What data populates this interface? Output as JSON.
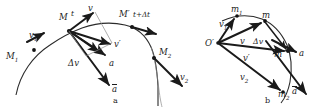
{
  "figure": {
    "background_color": "#ffffff",
    "ink_color": "#1c1c1c",
    "width": 318,
    "height": 108
  },
  "panel_a": {
    "caption": "a",
    "labels": {
      "point_M1": "M",
      "point_M1_sub": "1",
      "point_M": "M",
      "time_t": "t",
      "point_Mprime": "M′",
      "time_t_plus_dt": "t+Δt",
      "point_M2": "M",
      "point_M2_sub": "2",
      "vel_v1": "v",
      "vel_v1_sub": "1",
      "vel_v": "v",
      "vel_vprime": "v′",
      "vel_v2": "v",
      "vel_v2_sub": "2",
      "delta_v": "Δv",
      "accel_a": "a",
      "accel_a_bar": "a"
    }
  },
  "panel_b": {
    "caption": "b",
    "labels": {
      "origin": "O′",
      "point_m1": "m",
      "point_m1_sub": "1",
      "point_m": "m",
      "point_mprime": "m′",
      "point_m2": "m",
      "point_m2_sub": "2",
      "vel_v1": "v",
      "vel_v1_sub": "1",
      "vel_v": "v",
      "vel_vprime": "v′",
      "vel_v2": "v",
      "vel_v2_sub": "2",
      "delta_v": "Δv",
      "accel_a": "a",
      "accel_a_bar": "a"
    }
  }
}
